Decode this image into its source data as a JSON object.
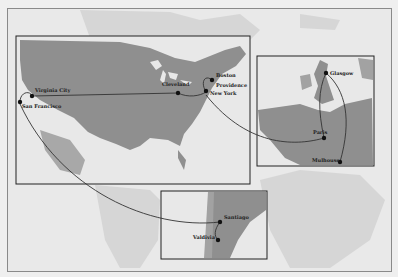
{
  "map": {
    "type": "route-map",
    "style": "grayscale scanned print",
    "colors": {
      "paper": "#efefef",
      "background_land": "#cfcfcf",
      "inset_land": "#8f8f8f",
      "water": "#e6e6e6",
      "route_line": "#333333",
      "city_marker": "#111111"
    },
    "insets": [
      {
        "id": "north-america",
        "region": "United States",
        "cities": [
          {
            "name": "Virginia City"
          },
          {
            "name": "San Francisco"
          },
          {
            "name": "Cleveland"
          },
          {
            "name": "Boston"
          },
          {
            "name": "Providence"
          },
          {
            "name": "New York"
          }
        ]
      },
      {
        "id": "europe",
        "region": "Western Europe",
        "cities": [
          {
            "name": "Glasgow"
          },
          {
            "name": "Paris"
          },
          {
            "name": "Mulhouse"
          }
        ]
      },
      {
        "id": "south-america",
        "region": "Chile / Argentina",
        "cities": [
          {
            "name": "Santiago"
          },
          {
            "name": "Valdivia"
          }
        ]
      }
    ],
    "routes": [
      {
        "from": "San Francisco",
        "to": "Virginia City"
      },
      {
        "from": "Virginia City",
        "to": "Cleveland"
      },
      {
        "from": "Cleveland",
        "to": "New York"
      },
      {
        "from": "New York",
        "to": "Boston"
      },
      {
        "from": "Boston",
        "to": "Providence"
      },
      {
        "from": "New York",
        "to": "Paris"
      },
      {
        "from": "Paris",
        "to": "Glasgow"
      },
      {
        "from": "Glasgow",
        "to": "Mulhouse"
      },
      {
        "from": "San Francisco",
        "to": "Santiago"
      },
      {
        "from": "Santiago",
        "to": "Valdivia"
      }
    ]
  }
}
